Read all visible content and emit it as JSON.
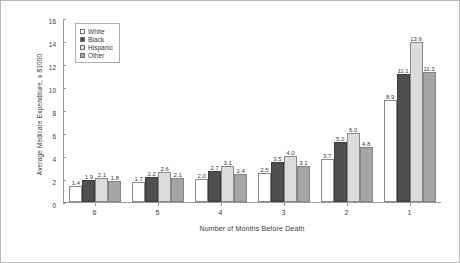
{
  "chart_data": {
    "type": "bar",
    "title": "",
    "xlabel": "Number of Months Before Death",
    "ylabel": "Average Medicare Expenditure, x $1000",
    "categories": [
      "6",
      "5",
      "4",
      "3",
      "2",
      "1"
    ],
    "ylim": [
      0,
      16
    ],
    "yticks": [
      0,
      2,
      4,
      6,
      8,
      10,
      12,
      14,
      16
    ],
    "grid": false,
    "legend_position": "top-left",
    "series": [
      {
        "name": "White",
        "color": "#ffffff",
        "values": [
          1.4,
          1.7,
          2.0,
          2.5,
          3.7,
          8.9
        ]
      },
      {
        "name": "Black",
        "color": "#4f4f4f",
        "values": [
          1.9,
          2.2,
          2.7,
          3.5,
          5.2,
          11.1
        ]
      },
      {
        "name": "Hispanic",
        "color": "#dcdcdc",
        "values": [
          2.1,
          2.6,
          3.1,
          4.0,
          6.0,
          13.9
        ]
      },
      {
        "name": "Other",
        "color": "#a6a6a6",
        "values": [
          1.8,
          2.1,
          2.4,
          3.1,
          4.8,
          11.3
        ]
      }
    ]
  }
}
